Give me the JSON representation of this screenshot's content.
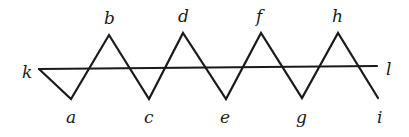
{
  "diagram": {
    "type": "zigzag-crossing-line",
    "stroke_color": "#1a1a1a",
    "background": "#ffffff",
    "zigzag": {
      "points": [
        {
          "name": "k",
          "x": 39,
          "y": 69
        },
        {
          "name": "a",
          "x": 71,
          "y": 99
        },
        {
          "name": "b",
          "x": 109,
          "y": 35
        },
        {
          "name": "c",
          "x": 149,
          "y": 99
        },
        {
          "name": "d",
          "x": 183,
          "y": 33
        },
        {
          "name": "e",
          "x": 226,
          "y": 99
        },
        {
          "name": "f",
          "x": 261,
          "y": 33
        },
        {
          "name": "g",
          "x": 302,
          "y": 98
        },
        {
          "name": "h",
          "x": 338,
          "y": 33
        },
        {
          "name": "i",
          "x": 378,
          "y": 98
        }
      ]
    },
    "line": {
      "from": {
        "name": "k",
        "x": 39,
        "y": 69
      },
      "to": {
        "name": "l",
        "x": 377,
        "y": 66
      }
    },
    "labels": {
      "k": {
        "text": "k",
        "x": 22,
        "y": 78
      },
      "a": {
        "text": "a",
        "x": 66,
        "y": 123
      },
      "b": {
        "text": "b",
        "x": 104,
        "y": 24
      },
      "c": {
        "text": "c",
        "x": 144,
        "y": 123
      },
      "d": {
        "text": "d",
        "x": 178,
        "y": 22
      },
      "e": {
        "text": "e",
        "x": 220,
        "y": 123
      },
      "f": {
        "text": "f",
        "x": 256,
        "y": 22
      },
      "g": {
        "text": "g",
        "x": 296,
        "y": 123
      },
      "h": {
        "text": "h",
        "x": 332,
        "y": 22
      },
      "i": {
        "text": "i",
        "x": 377,
        "y": 123
      },
      "l": {
        "text": "l",
        "x": 386,
        "y": 75
      }
    }
  }
}
